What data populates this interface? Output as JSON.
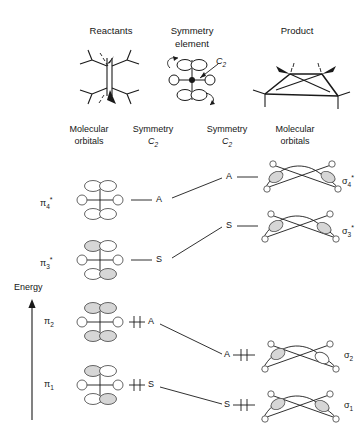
{
  "figure": {
    "title_columns": [
      {
        "id": "reactants",
        "label": "Reactants"
      },
      {
        "id": "symmetry-element",
        "label": "Symmetry",
        "label2": "element"
      },
      {
        "id": "product",
        "label": "Product"
      }
    ],
    "symmetry_element_name": "C",
    "symmetry_element_sub": "2",
    "sub_headers": [
      {
        "id": "left-mo",
        "line1": "Molecular",
        "line2": "orbitals"
      },
      {
        "id": "left-symmetry",
        "line1": "Symmetry",
        "line2": "C",
        "line2_sub": "2"
      },
      {
        "id": "right-symmetry",
        "line1": "Symmetry",
        "line2": "C",
        "line2_sub": "2"
      },
      {
        "id": "right-mo",
        "line1": "Molecular",
        "line2": "orbitals"
      }
    ],
    "axis": {
      "label": "Energy",
      "direction": "up"
    },
    "correlation_rows": [
      {
        "id": "row-4",
        "left_label": "π",
        "left_sub": "4",
        "left_star": "*",
        "left_symmetry": "A",
        "right_symmetry": "A",
        "right_label": "σ",
        "right_sub": "4",
        "right_star": "*",
        "left_occupied": false,
        "right_occupied": false,
        "left_lobes": [
          "white",
          "white",
          "white",
          "white"
        ],
        "connects_to": "A-upper"
      },
      {
        "id": "row-3",
        "left_label": "π",
        "left_sub": "3",
        "left_star": "*",
        "left_symmetry": "S",
        "right_symmetry": "S",
        "right_label": "σ",
        "right_sub": "3",
        "right_star": "*",
        "left_occupied": false,
        "right_occupied": false,
        "left_lobes": [
          "shaded",
          "white",
          "white",
          "shaded"
        ],
        "connects_to": "S-upper"
      },
      {
        "id": "row-2",
        "left_label": "π",
        "left_sub": "2",
        "left_star": "",
        "left_symmetry": "A",
        "right_symmetry": "A",
        "right_label": "σ",
        "right_sub": "2",
        "right_star": "",
        "left_occupied": true,
        "right_occupied": true,
        "left_lobes": [
          "shaded",
          "shaded",
          "shaded",
          "shaded"
        ],
        "connects_to": "A-lower"
      },
      {
        "id": "row-1",
        "left_label": "π",
        "left_sub": "1",
        "left_star": "",
        "left_symmetry": "S",
        "right_symmetry": "S",
        "right_label": "σ",
        "right_sub": "1",
        "right_star": "",
        "left_occupied": true,
        "right_occupied": true,
        "left_lobes": [
          "shaded",
          "white",
          "white",
          "shaded"
        ],
        "connects_to": "S-lower"
      }
    ],
    "colors": {
      "ink": "#1a1a1a",
      "lobe_shaded": "#d6d6d6",
      "lobe_white": "#ffffff",
      "outline": "#555555",
      "background": "#ffffff"
    }
  }
}
